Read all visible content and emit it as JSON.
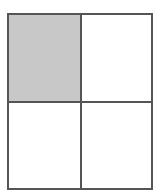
{
  "diagram": {
    "type": "2x2-grid",
    "rows": 2,
    "cols": 2,
    "border_color": "#555555",
    "cells": [
      {
        "id": "top-left",
        "row": 0,
        "col": 0,
        "shaded": true,
        "fill": "#c8c8c8"
      },
      {
        "id": "top-right",
        "row": 0,
        "col": 1,
        "shaded": false,
        "fill": "#ffffff"
      },
      {
        "id": "bottom-left",
        "row": 1,
        "col": 0,
        "shaded": false,
        "fill": "#ffffff"
      },
      {
        "id": "bottom-right",
        "row": 1,
        "col": 1,
        "shaded": false,
        "fill": "#ffffff"
      }
    ]
  }
}
